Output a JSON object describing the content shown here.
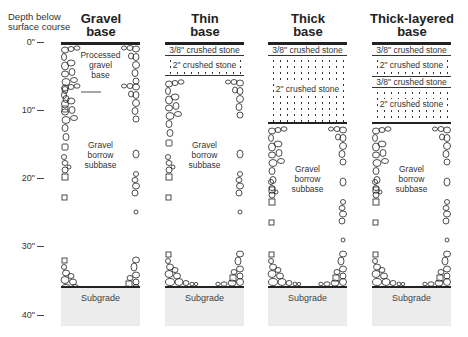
{
  "axis": {
    "title_line1": "Depth below",
    "title_line2": "surface course",
    "ticks": [
      "0\"",
      "10\"",
      "20\"",
      "30\"",
      "40\""
    ]
  },
  "columns": [
    {
      "title_line1": "Gravel",
      "title_line2": "base",
      "layers": [],
      "base_label": [
        "Processed",
        "gravel",
        "base"
      ],
      "subbase_label": [
        "Gravel",
        "borrow",
        "subbase"
      ],
      "subgrade_label": "Subgrade"
    },
    {
      "title_line1": "Thin",
      "title_line2": "base",
      "layers": [
        {
          "label": "3/8\" crushed stone"
        },
        {
          "label": "2\" crushed stone"
        }
      ],
      "subbase_label": [
        "Gravel",
        "borrow",
        "subbase"
      ],
      "subgrade_label": "Subgrade"
    },
    {
      "title_line1": "Thick",
      "title_line2": "base",
      "layers": [
        {
          "label": "3/8\" crushed stone"
        },
        {
          "label": "2\" crushed stone"
        }
      ],
      "subbase_label": [
        "Gravel",
        "borrow",
        "subbase"
      ],
      "subgrade_label": "Subgrade"
    },
    {
      "title_line1": "Thick-layered",
      "title_line2": "base",
      "layers": [
        {
          "label": "3/8\" crushed stone"
        },
        {
          "label": "2\" crushed stone"
        },
        {
          "label": "3/8\" crushed stone"
        },
        {
          "label": "2\" crushed stone"
        }
      ],
      "subbase_label": [
        "Gravel",
        "borrow",
        "subbase"
      ],
      "subgrade_label": "Subgrade"
    }
  ]
}
